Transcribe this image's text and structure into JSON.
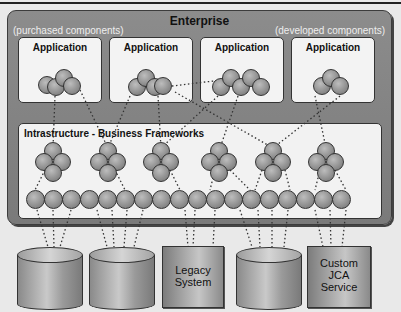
{
  "diagram": {
    "title": "Enterprise",
    "notes": {
      "left": "(purchased components)",
      "right": "(developed components)"
    },
    "applications": [
      {
        "label": "Application"
      },
      {
        "label": "Application"
      },
      {
        "label": "Application"
      },
      {
        "label": "Application"
      }
    ],
    "infrastructure": {
      "label": "Intrastructure - Business Frameworks",
      "framework_cluster_count": 6,
      "component_ball_count": 19
    },
    "resources": [
      {
        "type": "database",
        "label": ""
      },
      {
        "type": "database",
        "label": ""
      },
      {
        "type": "system",
        "label_line1": "Legacy",
        "label_line2": "System"
      },
      {
        "type": "database",
        "label": ""
      },
      {
        "type": "system",
        "label_line1": "Custom",
        "label_line2": "JCA",
        "label_line3": "Service"
      }
    ],
    "colors": {
      "enterprise_bg": "#808080",
      "panel_bg": "#f2f2f2",
      "ball": "#8e8e8e",
      "outline": "#333333"
    }
  }
}
